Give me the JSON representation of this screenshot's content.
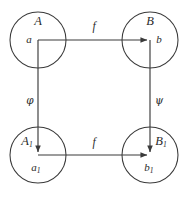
{
  "diagram": {
    "type": "commutative-square",
    "title": "",
    "colors": {
      "stroke": "#3a3a3a",
      "text": "#2b2b2b",
      "background": "#ffffff"
    },
    "nodes": [
      {
        "id": "top-left",
        "set_label": "A",
        "element_label": "a",
        "cx": 38,
        "cy": 40,
        "r": 28
      },
      {
        "id": "top-right",
        "set_label": "B",
        "element_label": "b",
        "cx": 150,
        "cy": 40,
        "r": 28
      },
      {
        "id": "bottom-left",
        "set_label": "A",
        "set_label_sub": "1",
        "element_label": "a",
        "element_label_sub": "1",
        "cx": 38,
        "cy": 155,
        "r": 28
      },
      {
        "id": "bottom-right",
        "set_label": "B",
        "set_label_sub": "1",
        "element_label": "b",
        "element_label_sub": "1",
        "cx": 150,
        "cy": 155,
        "r": 28
      }
    ],
    "edges": [
      {
        "id": "top-map",
        "label": "f",
        "from": "top-left",
        "to": "top-right",
        "direction": "right"
      },
      {
        "id": "left-map",
        "label": "φ",
        "from": "top-left",
        "to": "bottom-left",
        "direction": "down"
      },
      {
        "id": "right-map",
        "label": "ψ",
        "from": "top-right",
        "to": "bottom-right",
        "direction": "down"
      },
      {
        "id": "bottom-map",
        "label": "f",
        "from": "bottom-left",
        "to": "bottom-right",
        "direction": "right"
      }
    ]
  }
}
